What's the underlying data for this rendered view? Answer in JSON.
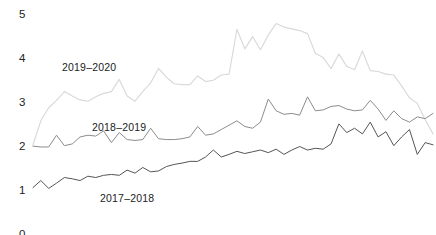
{
  "chart_data": {
    "type": "line",
    "title": "",
    "subtitle": "",
    "xlabel": "",
    "ylabel": "",
    "xlim": [
      0,
      51
    ],
    "ylim": [
      0,
      5
    ],
    "grid": false,
    "legend_position": "inline-annotations",
    "y_ticks": [
      "0",
      "1",
      "2",
      "3",
      "4",
      "5"
    ],
    "y_tick_values": [
      0,
      1,
      2,
      3,
      4,
      5
    ],
    "x": [
      0,
      1,
      2,
      3,
      4,
      5,
      6,
      7,
      8,
      9,
      10,
      11,
      12,
      13,
      14,
      15,
      16,
      17,
      18,
      19,
      20,
      21,
      22,
      23,
      24,
      25,
      26,
      27,
      28,
      29,
      30,
      31,
      32,
      33,
      34,
      35,
      36,
      37,
      38,
      39,
      40,
      41,
      42,
      43,
      44,
      45,
      46,
      47,
      48,
      49,
      50,
      51
    ],
    "series": [
      {
        "name": "2019–2020",
        "color": "#d9d9d9",
        "label_x": 62,
        "label_y": 62,
        "values": [
          2.0,
          2.55,
          2.85,
          3.02,
          3.22,
          3.12,
          3.03,
          3.0,
          3.1,
          3.18,
          3.22,
          3.5,
          3.12,
          3.0,
          3.22,
          3.42,
          3.75,
          3.55,
          3.4,
          3.38,
          3.38,
          3.58,
          3.45,
          3.48,
          3.6,
          3.62,
          4.65,
          4.2,
          4.48,
          4.18,
          4.52,
          4.78,
          4.7,
          4.66,
          4.62,
          4.55,
          4.1,
          4.0,
          3.75,
          4.08,
          3.8,
          3.72,
          4.15,
          3.7,
          3.68,
          3.62,
          3.6,
          3.35,
          3.08,
          2.95,
          2.58,
          2.25
        ]
      },
      {
        "name": "2018–2019",
        "color": "#8c8c8c",
        "label_x": 92,
        "label_y": 122,
        "values": [
          1.97,
          1.95,
          1.95,
          2.22,
          1.98,
          2.02,
          2.18,
          2.22,
          2.2,
          2.32,
          2.05,
          2.28,
          2.12,
          2.1,
          2.12,
          2.38,
          2.14,
          2.12,
          2.12,
          2.14,
          2.18,
          2.42,
          2.22,
          2.25,
          2.35,
          2.45,
          2.55,
          2.42,
          2.38,
          2.52,
          3.05,
          2.78,
          2.7,
          2.72,
          2.68,
          3.1,
          2.78,
          2.8,
          2.88,
          2.9,
          2.82,
          2.78,
          2.8,
          3.02,
          2.82,
          2.56,
          2.78,
          2.6,
          2.52,
          2.64,
          2.6,
          2.72
        ]
      },
      {
        "name": "2017–2018",
        "color": "#555555",
        "label_x": 100,
        "label_y": 193,
        "values": [
          1.02,
          1.18,
          1.0,
          1.12,
          1.25,
          1.22,
          1.18,
          1.28,
          1.25,
          1.3,
          1.32,
          1.3,
          1.42,
          1.35,
          1.48,
          1.38,
          1.4,
          1.5,
          1.55,
          1.58,
          1.62,
          1.62,
          1.72,
          1.88,
          1.72,
          1.78,
          1.85,
          1.8,
          1.84,
          1.88,
          1.82,
          1.9,
          1.78,
          1.88,
          1.96,
          1.88,
          1.92,
          1.9,
          2.02,
          2.48,
          2.28,
          2.38,
          2.25,
          2.52,
          2.18,
          2.3,
          1.98,
          2.18,
          2.35,
          1.78,
          2.05,
          2.0
        ]
      }
    ]
  },
  "axis": {
    "y_labels": [
      {
        "text": "5",
        "top": 9
      },
      {
        "text": "4",
        "top": 53
      },
      {
        "text": "3",
        "top": 97
      },
      {
        "text": "2",
        "top": 141
      },
      {
        "text": "1",
        "top": 185
      },
      {
        "text": "0",
        "top": 229
      }
    ]
  }
}
